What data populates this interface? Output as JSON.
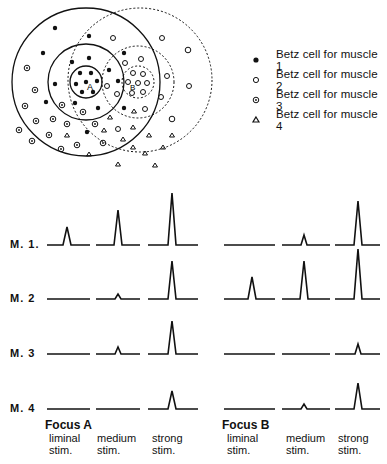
{
  "legend": {
    "items": [
      {
        "symbol": "filled-dot",
        "label": "Betz cell for muscle 1"
      },
      {
        "symbol": "open-circle",
        "label": "Betz cell for muscle 2"
      },
      {
        "symbol": "dotted-circle",
        "label": "Betz cell for muscle 3"
      },
      {
        "symbol": "triangle",
        "label": "Betz cell for muscle 4"
      }
    ]
  },
  "map": {
    "focus_a_label": "A",
    "focus_b_label": "B"
  },
  "rows": [
    {
      "label": "M. 1."
    },
    {
      "label": "M. 2"
    },
    {
      "label": "M. 3"
    },
    {
      "label": "M. 4"
    }
  ],
  "focus_a": {
    "title": "Focus A",
    "stims": [
      "liminal\nstim.",
      "medium\nstim.",
      "strong\nstim."
    ]
  },
  "focus_b": {
    "title": "Focus B",
    "stims": [
      "liminal\nstim.",
      "medium\nstim.",
      "strong\nstim."
    ]
  },
  "chart_data": {
    "type": "line",
    "rows": [
      "M. 1",
      "M. 2",
      "M. 3",
      "M. 4"
    ],
    "columns": [
      "Focus A liminal",
      "Focus A medium",
      "Focus A strong",
      "Focus B liminal",
      "Focus B medium",
      "Focus B strong"
    ],
    "peak_heights_px": [
      [
        18,
        35,
        52,
        0,
        10,
        44
      ],
      [
        0,
        5,
        38,
        22,
        38,
        50
      ],
      [
        0,
        7,
        33,
        0,
        0,
        10
      ],
      [
        0,
        0,
        18,
        0,
        5,
        26
      ]
    ]
  }
}
